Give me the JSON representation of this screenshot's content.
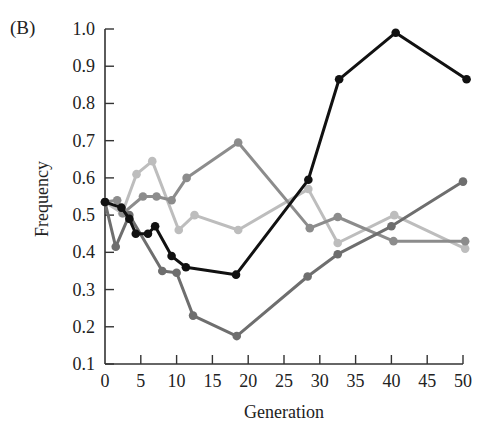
{
  "panel_label": "(B)",
  "chart_data": {
    "type": "line",
    "title": "",
    "xlabel": "Generation",
    "ylabel": "Frequency",
    "xlim": [
      0,
      50
    ],
    "ylim": [
      0.1,
      1.0
    ],
    "xticks": [
      0,
      5,
      10,
      15,
      20,
      25,
      30,
      35,
      40,
      45,
      50
    ],
    "yticks": [
      "0.1",
      "0.2",
      "0.3",
      "0.4",
      "0.5",
      "0.6",
      "0.7",
      "0.8",
      "0.9",
      "1.0"
    ],
    "grid": false,
    "legend": null,
    "series": [
      {
        "name": "Population 1 (light gray)",
        "color": "#bdbdbd",
        "x": [
          0,
          2.4,
          4.4,
          6.6,
          10.3,
          12.5,
          18.6,
          28.4,
          32.5,
          40.4,
          50.3
        ],
        "y": [
          0.535,
          0.505,
          0.61,
          0.645,
          0.46,
          0.5,
          0.46,
          0.57,
          0.425,
          0.5,
          0.41
        ]
      },
      {
        "name": "Population 2 (medium gray)",
        "color": "#8c8c8c",
        "x": [
          0,
          1.7,
          2.5,
          5.3,
          7.2,
          9.3,
          11.4,
          18.6,
          28.6,
          32.5,
          40.3,
          50.3
        ],
        "y": [
          0.535,
          0.54,
          0.505,
          0.55,
          0.55,
          0.54,
          0.6,
          0.695,
          0.465,
          0.495,
          0.43,
          0.43
        ]
      },
      {
        "name": "Population 3 (dark gray)",
        "color": "#6e6e6e",
        "x": [
          0,
          1.5,
          3.4,
          8.0,
          10.0,
          12.3,
          18.4,
          28.3,
          32.5,
          40.0,
          50.0
        ],
        "y": [
          0.535,
          0.415,
          0.5,
          0.35,
          0.345,
          0.23,
          0.175,
          0.335,
          0.395,
          0.47,
          0.59
        ]
      },
      {
        "name": "Population 4 (black)",
        "color": "#111111",
        "x": [
          0,
          2.3,
          3.4,
          4.3,
          6.0,
          7.0,
          9.3,
          11.3,
          18.3,
          28.4,
          32.7,
          40.6,
          50.5
        ],
        "y": [
          0.535,
          0.52,
          0.49,
          0.45,
          0.45,
          0.47,
          0.39,
          0.36,
          0.34,
          0.595,
          0.865,
          0.99,
          0.865
        ]
      }
    ]
  }
}
